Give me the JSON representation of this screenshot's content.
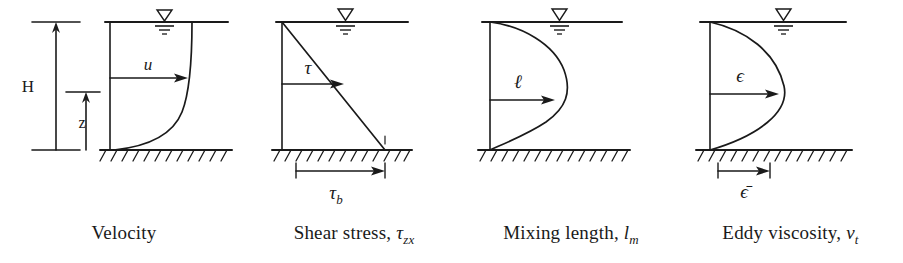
{
  "figure": {
    "kind": "four-panel vertical profile diagram of turbulent open-channel flow",
    "background_color": "#ffffff",
    "ink_color": "#1a1a1a"
  },
  "panels": [
    {
      "id": "velocity",
      "caption": "Velocity",
      "caption_symbol": "",
      "caption_subscript": "",
      "curve_symbol": "u",
      "profile_shape": "logarithmic",
      "profile_description": "maximum at water surface, decreasing to zero at the bed",
      "water_surface_symbol": "water-surface-triangle",
      "depth_label": "H",
      "elevation_label": "z",
      "bed_label": "",
      "bed_hatching": true
    },
    {
      "id": "shear-stress",
      "caption": "Shear stress,",
      "caption_symbol": "τ",
      "caption_subscript": "zx",
      "curve_symbol": "τ",
      "profile_shape": "linear",
      "profile_description": "zero at water surface, increasing linearly to maximum at the bed",
      "water_surface_symbol": "water-surface-triangle",
      "depth_label": "",
      "elevation_label": "",
      "bed_label": "τ",
      "bed_label_subscript": "b",
      "bed_hatching": true
    },
    {
      "id": "mixing-length",
      "caption": "Mixing length,",
      "caption_symbol": "l",
      "caption_subscript": "m",
      "curve_symbol": "ℓ",
      "profile_shape": "asymmetric-parabolic",
      "profile_description": "zero at the bed, rising to a maximum in the upper portion of the depth, returning to zero at the water surface",
      "water_surface_symbol": "water-surface-triangle",
      "depth_label": "",
      "elevation_label": "",
      "bed_label": "",
      "bed_hatching": true
    },
    {
      "id": "eddy-viscosity",
      "caption": "Eddy viscosity,",
      "caption_symbol": "v",
      "caption_subscript": "t",
      "curve_symbol": "ϵ",
      "profile_shape": "parabolic",
      "profile_description": "zero at bed and at water surface, maximum near mid-depth",
      "water_surface_symbol": "water-surface-triangle",
      "depth_label": "",
      "elevation_label": "",
      "bed_label": "ϵ̄",
      "bed_label_subscript": "",
      "bed_hatching": true
    }
  ]
}
